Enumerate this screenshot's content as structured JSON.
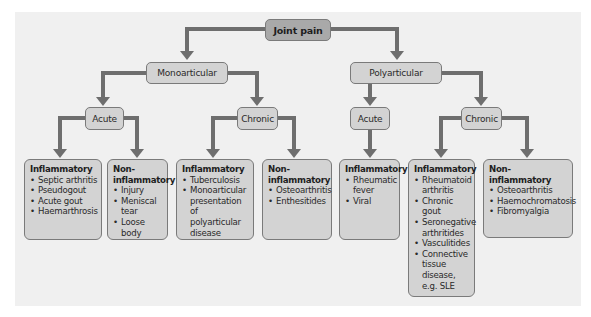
{
  "root": {
    "label": "Joint pain"
  },
  "monoarticular": {
    "label": "Monoarticular",
    "acute": {
      "label": "Acute",
      "inflammatory": {
        "heading": "Inflammatory",
        "items": [
          "Septic arthritis",
          "Pseudogout",
          "Acute gout",
          "Haemarthrosis"
        ]
      },
      "non_inflammatory": {
        "heading": "Non-inflammatory",
        "items": [
          "Injury",
          "Meniscal tear",
          "Loose body"
        ]
      }
    },
    "chronic": {
      "label": "Chronic",
      "inflammatory": {
        "heading": "Inflammatory",
        "items": [
          "Tuberculosis",
          "Monoarticular presentation of polyarticular disease"
        ]
      },
      "non_inflammatory": {
        "heading": "Non-inflammatory",
        "items": [
          "Osteoarthritis",
          "Enthesitides"
        ]
      }
    }
  },
  "polyarticular": {
    "label": "Polyarticular",
    "acute": {
      "label": "Acute",
      "inflammatory": {
        "heading": "Inflammatory",
        "items": [
          "Rheumatic fever",
          "Viral"
        ]
      }
    },
    "chronic": {
      "label": "Chronic",
      "inflammatory": {
        "heading": "Inflammatory",
        "items": [
          "Rheumatoid arthritis",
          "Chronic gout",
          "Seronegative arthritides",
          "Vasculitides",
          "Connective tissue disease, e.g. SLE"
        ]
      },
      "non_inflammatory": {
        "heading": "Non-inflammatory",
        "items": [
          "Osteoarthritis",
          "Haemochromatosis",
          "Fibromyalgia"
        ]
      }
    }
  },
  "colors": {
    "root_fill": "#a9a9a9",
    "node_fill": "#d3d3d3",
    "arrow": "#6e6e6e",
    "panel": "#f0f0f0"
  }
}
